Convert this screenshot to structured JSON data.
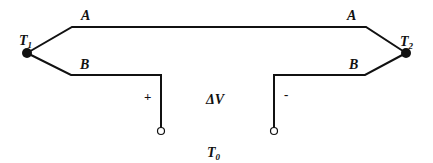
{
  "diagram": {
    "labels": {
      "wire_a_left": "A",
      "wire_a_right": "A",
      "wire_b_left": "B",
      "wire_b_right": "B",
      "junction_left": "T",
      "junction_left_sub": "1",
      "junction_right": "T",
      "junction_right_sub": "2",
      "reference": "T",
      "reference_sub": "0",
      "voltage": "ΔV",
      "plus": "+",
      "minus": "-"
    },
    "colors": {
      "line": "#111111",
      "background": "#ffffff"
    }
  }
}
